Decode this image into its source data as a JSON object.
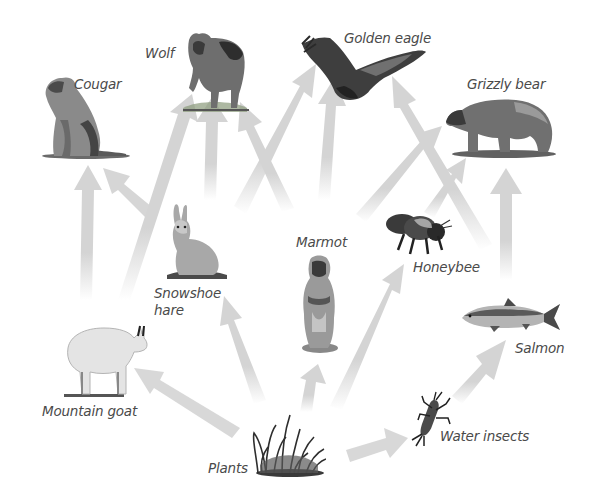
{
  "diagram": {
    "type": "food-web",
    "arrow_color": "#d4d4d4",
    "label_color": "#4a4a4a",
    "nodes": [
      {
        "id": "cougar",
        "label": "Cougar"
      },
      {
        "id": "wolf",
        "label": "Wolf"
      },
      {
        "id": "golden_eagle",
        "label": "Golden eagle"
      },
      {
        "id": "grizzly_bear",
        "label": "Grizzly bear"
      },
      {
        "id": "snowshoe_hare",
        "label_line1": "Snowshoe",
        "label_line2": "hare"
      },
      {
        "id": "marmot",
        "label": "Marmot"
      },
      {
        "id": "honeybee",
        "label": "Honeybee"
      },
      {
        "id": "salmon",
        "label": "Salmon"
      },
      {
        "id": "mountain_goat",
        "label": "Mountain goat"
      },
      {
        "id": "plants",
        "label": "Plants"
      },
      {
        "id": "water_insects",
        "label": "Water insects"
      }
    ],
    "edges": [
      {
        "from": "mountain_goat",
        "to": "cougar"
      },
      {
        "from": "snowshoe_hare",
        "to": "cougar"
      },
      {
        "from": "mountain_goat",
        "to": "wolf"
      },
      {
        "from": "snowshoe_hare",
        "to": "wolf"
      },
      {
        "from": "marmot",
        "to": "wolf"
      },
      {
        "from": "snowshoe_hare",
        "to": "golden_eagle"
      },
      {
        "from": "marmot",
        "to": "golden_eagle"
      },
      {
        "from": "salmon",
        "to": "golden_eagle"
      },
      {
        "from": "marmot",
        "to": "grizzly_bear"
      },
      {
        "from": "honeybee",
        "to": "grizzly_bear"
      },
      {
        "from": "salmon",
        "to": "grizzly_bear"
      },
      {
        "from": "plants",
        "to": "mountain_goat"
      },
      {
        "from": "plants",
        "to": "snowshoe_hare"
      },
      {
        "from": "plants",
        "to": "marmot"
      },
      {
        "from": "plants",
        "to": "honeybee"
      },
      {
        "from": "plants",
        "to": "water_insects"
      },
      {
        "from": "water_insects",
        "to": "salmon"
      }
    ]
  }
}
